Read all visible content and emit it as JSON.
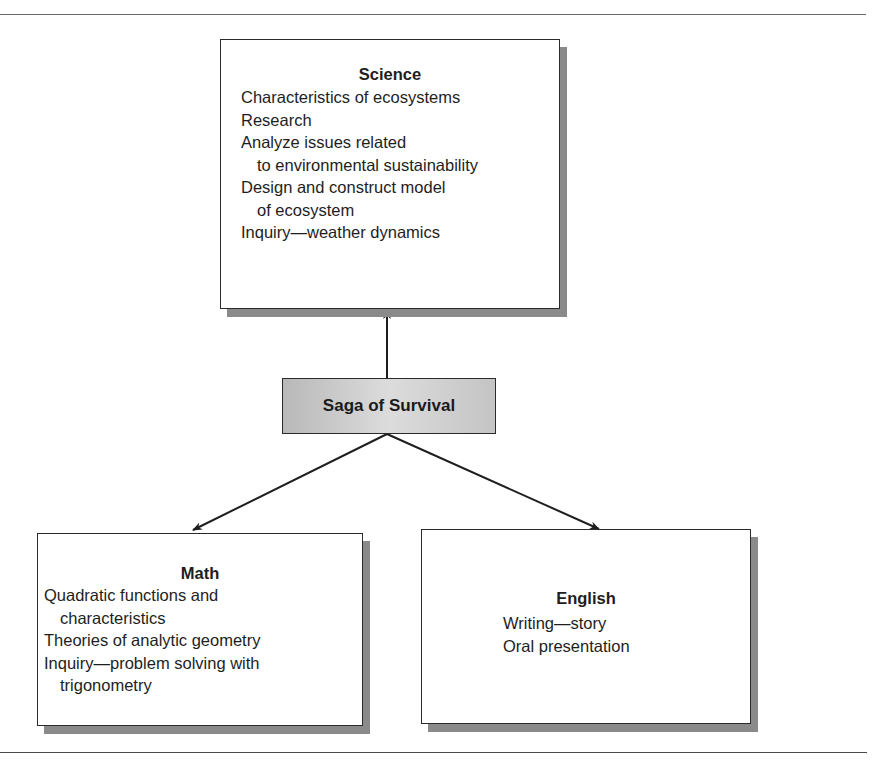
{
  "diagram": {
    "center": {
      "label": "Saga of Survival",
      "fill": "#c8c8c8"
    },
    "science": {
      "title": "Science",
      "lines": [
        {
          "text": "Characteristics of ecosystems",
          "indent": false
        },
        {
          "text": "Research",
          "indent": false
        },
        {
          "text": "Analyze issues related",
          "indent": false
        },
        {
          "text": "to environmental sustainability",
          "indent": true
        },
        {
          "text": "Design and construct model",
          "indent": false
        },
        {
          "text": "of ecosystem",
          "indent": true
        },
        {
          "text": "Inquiry—weather dynamics",
          "indent": false
        }
      ]
    },
    "math": {
      "title": "Math",
      "lines": [
        {
          "text": "Quadratic functions and",
          "indent": false
        },
        {
          "text": "characteristics",
          "indent": true
        },
        {
          "text": "Theories of analytic geometry",
          "indent": false
        },
        {
          "text": "Inquiry—problem solving with",
          "indent": false
        },
        {
          "text": "trigonometry",
          "indent": true
        }
      ]
    },
    "english": {
      "title": "English",
      "lines": [
        {
          "text": "Writing—story",
          "indent": false
        },
        {
          "text": "Oral presentation",
          "indent": false
        }
      ]
    },
    "edges": [
      {
        "from": "Saga of Survival",
        "to": "Science"
      },
      {
        "from": "Saga of Survival",
        "to": "Math"
      },
      {
        "from": "Saga of Survival",
        "to": "English"
      }
    ],
    "colors": {
      "line": "#1e1e1e",
      "shadow": "#8a8a8a",
      "box_fill": "#ffffff"
    }
  }
}
